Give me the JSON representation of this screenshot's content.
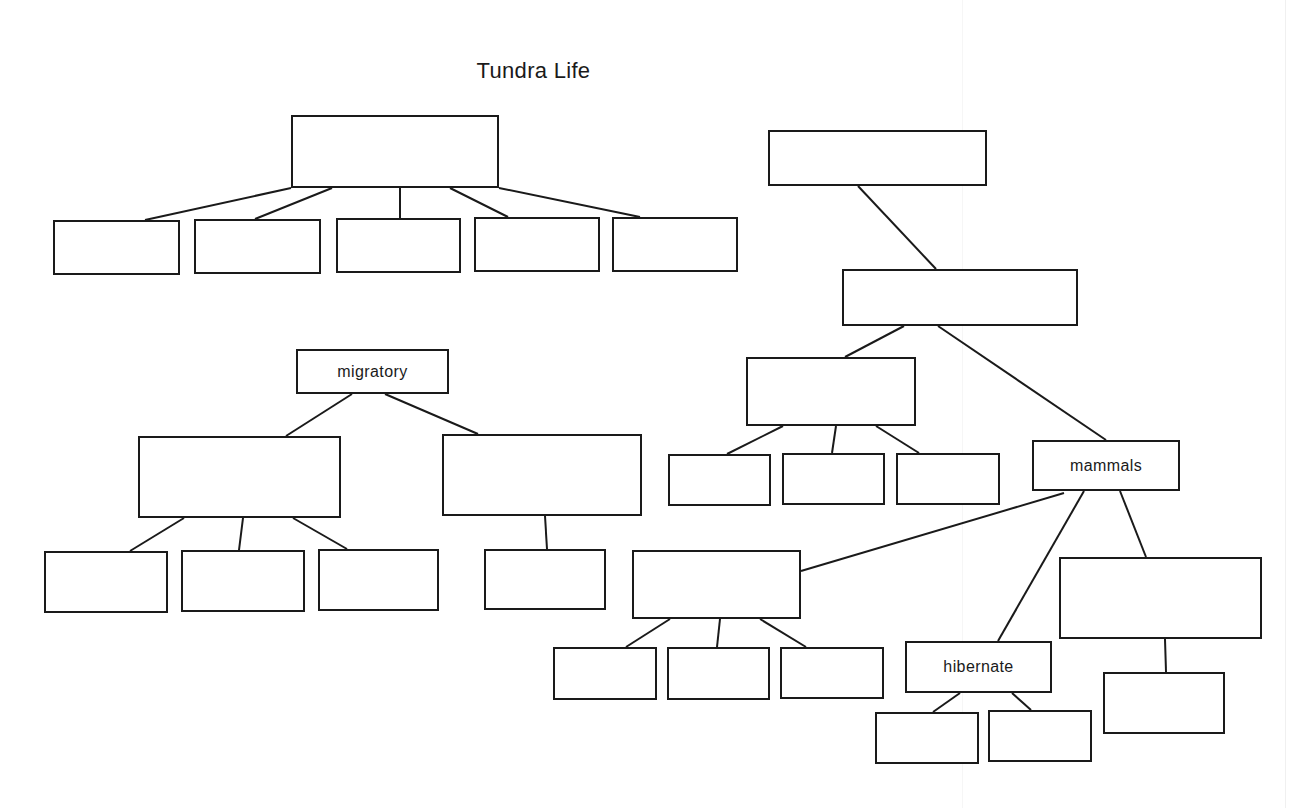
{
  "diagram": {
    "title": "Tundra Life",
    "stroke_color": "#1a1a1a",
    "background": "#ffffff",
    "nodes": [
      {
        "id": "n1",
        "label": "",
        "x": 291,
        "y": 115,
        "w": 208,
        "h": 73
      },
      {
        "id": "n2",
        "label": "",
        "x": 53,
        "y": 220,
        "w": 127,
        "h": 55
      },
      {
        "id": "n3",
        "label": "",
        "x": 194,
        "y": 219,
        "w": 127,
        "h": 55
      },
      {
        "id": "n4",
        "label": "",
        "x": 336,
        "y": 218,
        "w": 125,
        "h": 55
      },
      {
        "id": "n5",
        "label": "",
        "x": 474,
        "y": 217,
        "w": 126,
        "h": 55
      },
      {
        "id": "n6",
        "label": "",
        "x": 612,
        "y": 217,
        "w": 126,
        "h": 55
      },
      {
        "id": "n7",
        "label": "",
        "x": 768,
        "y": 130,
        "w": 219,
        "h": 56
      },
      {
        "id": "n8",
        "label": "",
        "x": 842,
        "y": 269,
        "w": 236,
        "h": 57
      },
      {
        "id": "n9",
        "label": "",
        "x": 746,
        "y": 357,
        "w": 170,
        "h": 69
      },
      {
        "id": "n10",
        "label": "",
        "x": 668,
        "y": 454,
        "w": 103,
        "h": 52
      },
      {
        "id": "n11",
        "label": "",
        "x": 782,
        "y": 453,
        "w": 103,
        "h": 52
      },
      {
        "id": "n12",
        "label": "",
        "x": 896,
        "y": 453,
        "w": 104,
        "h": 52
      },
      {
        "id": "n13",
        "label": "mammals",
        "x": 1032,
        "y": 440,
        "w": 148,
        "h": 51
      },
      {
        "id": "n14",
        "label": "migratory",
        "x": 296,
        "y": 349,
        "w": 153,
        "h": 45
      },
      {
        "id": "n15",
        "label": "",
        "x": 138,
        "y": 436,
        "w": 203,
        "h": 82
      },
      {
        "id": "n16",
        "label": "",
        "x": 442,
        "y": 434,
        "w": 200,
        "h": 82
      },
      {
        "id": "n17",
        "label": "",
        "x": 44,
        "y": 551,
        "w": 124,
        "h": 62
      },
      {
        "id": "n18",
        "label": "",
        "x": 181,
        "y": 550,
        "w": 124,
        "h": 62
      },
      {
        "id": "n19",
        "label": "",
        "x": 318,
        "y": 549,
        "w": 121,
        "h": 62
      },
      {
        "id": "n20",
        "label": "",
        "x": 484,
        "y": 549,
        "w": 122,
        "h": 61
      },
      {
        "id": "n21",
        "label": "",
        "x": 632,
        "y": 550,
        "w": 169,
        "h": 69
      },
      {
        "id": "n22",
        "label": "",
        "x": 553,
        "y": 647,
        "w": 104,
        "h": 53
      },
      {
        "id": "n23",
        "label": "",
        "x": 667,
        "y": 647,
        "w": 103,
        "h": 53
      },
      {
        "id": "n24",
        "label": "",
        "x": 780,
        "y": 647,
        "w": 104,
        "h": 52
      },
      {
        "id": "n25",
        "label": "hibernate",
        "x": 905,
        "y": 641,
        "w": 147,
        "h": 52
      },
      {
        "id": "n26",
        "label": "",
        "x": 1059,
        "y": 557,
        "w": 203,
        "h": 82
      },
      {
        "id": "n27",
        "label": "",
        "x": 875,
        "y": 712,
        "w": 104,
        "h": 52
      },
      {
        "id": "n28",
        "label": "",
        "x": 988,
        "y": 710,
        "w": 104,
        "h": 52
      },
      {
        "id": "n29",
        "label": "",
        "x": 1103,
        "y": 672,
        "w": 122,
        "h": 62
      }
    ],
    "edges": [
      {
        "from": "n1",
        "to": "n2",
        "x1": 291,
        "y1": 188,
        "x2": 145,
        "y2": 220
      },
      {
        "from": "n1",
        "to": "n3",
        "x1": 332,
        "y1": 188,
        "x2": 255,
        "y2": 219
      },
      {
        "from": "n1",
        "to": "n4",
        "x1": 400,
        "y1": 188,
        "x2": 400,
        "y2": 218
      },
      {
        "from": "n1",
        "to": "n5",
        "x1": 450,
        "y1": 188,
        "x2": 508,
        "y2": 217
      },
      {
        "from": "n1",
        "to": "n6",
        "x1": 499,
        "y1": 188,
        "x2": 640,
        "y2": 217
      },
      {
        "from": "n7",
        "to": "n8",
        "x1": 858,
        "y1": 186,
        "x2": 936,
        "y2": 269
      },
      {
        "from": "n8",
        "to": "n9",
        "x1": 904,
        "y1": 326,
        "x2": 845,
        "y2": 357
      },
      {
        "from": "n8",
        "to": "n13",
        "x1": 938,
        "y1": 326,
        "x2": 1106,
        "y2": 440
      },
      {
        "from": "n9",
        "to": "n10",
        "x1": 783,
        "y1": 426,
        "x2": 727,
        "y2": 454
      },
      {
        "from": "n9",
        "to": "n11",
        "x1": 836,
        "y1": 426,
        "x2": 832,
        "y2": 453
      },
      {
        "from": "n9",
        "to": "n12",
        "x1": 876,
        "y1": 426,
        "x2": 919,
        "y2": 453
      },
      {
        "from": "n14",
        "to": "n15",
        "x1": 352,
        "y1": 394,
        "x2": 286,
        "y2": 436
      },
      {
        "from": "n14",
        "to": "n16",
        "x1": 385,
        "y1": 394,
        "x2": 478,
        "y2": 434
      },
      {
        "from": "n15",
        "to": "n17",
        "x1": 184,
        "y1": 518,
        "x2": 130,
        "y2": 551
      },
      {
        "from": "n15",
        "to": "n18",
        "x1": 243,
        "y1": 518,
        "x2": 239,
        "y2": 550
      },
      {
        "from": "n15",
        "to": "n19",
        "x1": 293,
        "y1": 518,
        "x2": 347,
        "y2": 549
      },
      {
        "from": "n16",
        "to": "n20",
        "x1": 545,
        "y1": 516,
        "x2": 547,
        "y2": 549
      },
      {
        "from": "n13",
        "to": "n21",
        "x1": 1064,
        "y1": 493,
        "x2": 801,
        "y2": 571
      },
      {
        "from": "n13",
        "to": "n25",
        "x1": 1084,
        "y1": 491,
        "x2": 998,
        "y2": 641
      },
      {
        "from": "n13",
        "to": "n26",
        "x1": 1120,
        "y1": 491,
        "x2": 1146,
        "y2": 557
      },
      {
        "from": "n21",
        "to": "n22",
        "x1": 670,
        "y1": 619,
        "x2": 626,
        "y2": 647
      },
      {
        "from": "n21",
        "to": "n23",
        "x1": 720,
        "y1": 619,
        "x2": 717,
        "y2": 647
      },
      {
        "from": "n21",
        "to": "n24",
        "x1": 760,
        "y1": 619,
        "x2": 806,
        "y2": 647
      },
      {
        "from": "n25",
        "to": "n27",
        "x1": 960,
        "y1": 693,
        "x2": 933,
        "y2": 712
      },
      {
        "from": "n25",
        "to": "n28",
        "x1": 1012,
        "y1": 693,
        "x2": 1031,
        "y2": 710
      },
      {
        "from": "n26",
        "to": "n29",
        "x1": 1165,
        "y1": 639,
        "x2": 1166,
        "y2": 672
      }
    ]
  }
}
